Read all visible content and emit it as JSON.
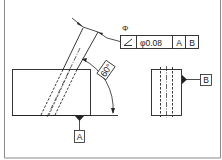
{
  "drawing": {
    "type": "GD&T angularity callout",
    "colors": {
      "line": "#222222",
      "border": "#888888",
      "background": "#ffffff"
    },
    "feature_control_frame": {
      "diameter_symbol_label": "Φ",
      "characteristic_symbol": "∠",
      "characteristic_name": "angularity",
      "tolerance": "φ0.08",
      "datum_primary": "A",
      "datum_secondary": "B"
    },
    "angle_dimension": {
      "value": "60°"
    },
    "datums": [
      {
        "label": "A"
      },
      {
        "label": "B"
      }
    ]
  }
}
